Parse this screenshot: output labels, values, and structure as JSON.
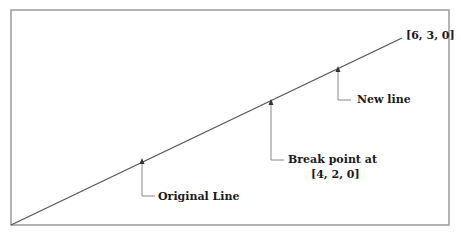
{
  "diagram": {
    "type": "line-break-illustration",
    "frame": {
      "left": 11,
      "top": 10,
      "right": 449,
      "bottom": 225,
      "color": "#9a9a9a"
    },
    "line": {
      "start": [
        11,
        225
      ],
      "end": [
        402,
        38
      ],
      "color": "#555555"
    },
    "end_point_label": "[6, 3, 0]",
    "annotations": [
      {
        "id": "original",
        "label": "Original Line",
        "arrow_x": 142,
        "arrow_top": 159,
        "elbow_y": 196
      },
      {
        "id": "break",
        "label_line1": "Break point at",
        "label_line2": "[4, 2, 0]",
        "arrow_x": 271,
        "arrow_top": 100,
        "elbow_y": 160
      },
      {
        "id": "new",
        "label": "New line",
        "arrow_x": 338,
        "arrow_top": 67,
        "elbow_y": 100
      }
    ]
  }
}
